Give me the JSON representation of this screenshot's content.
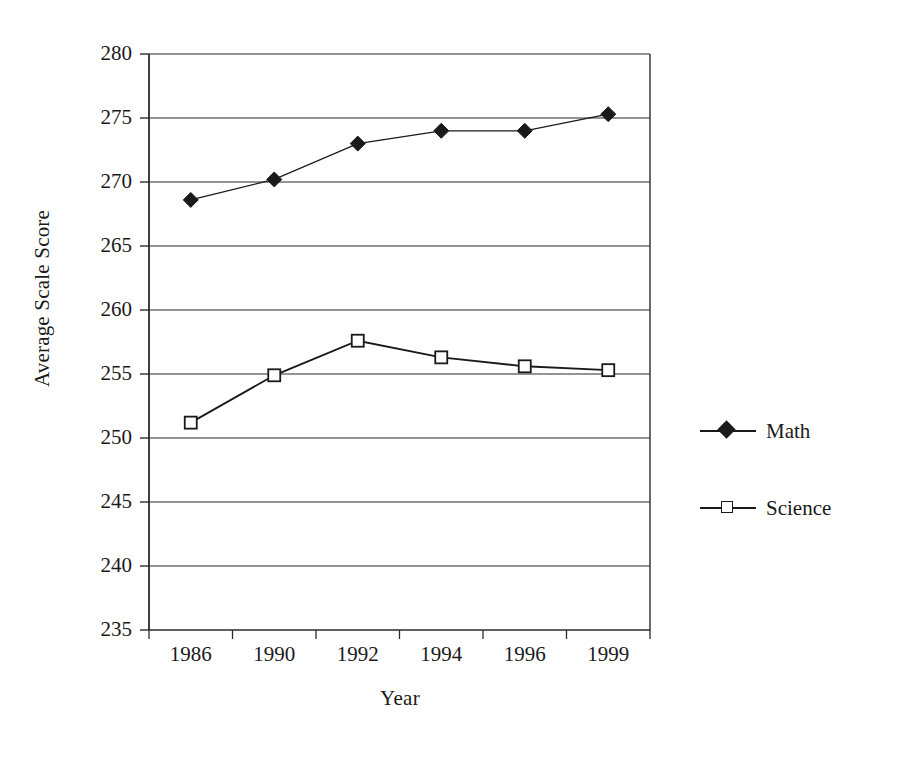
{
  "chart_data": {
    "type": "line",
    "title": "",
    "xlabel": "Year",
    "ylabel": "Average Scale Score",
    "categories": [
      "1986",
      "1990",
      "1992",
      "1994",
      "1996",
      "1999"
    ],
    "ylim": [
      235,
      280
    ],
    "yticks": [
      235,
      240,
      245,
      250,
      255,
      260,
      265,
      270,
      275,
      280
    ],
    "ytick_labels": [
      "235",
      "240",
      "245",
      "250",
      "255",
      "260",
      "265",
      "270",
      "275",
      "280"
    ],
    "grid": "horizontal",
    "legend_position": "right",
    "series": [
      {
        "name": "Math",
        "marker": "filled-diamond",
        "color": "#1a1a1a",
        "values": [
          268.6,
          270.2,
          273.0,
          274.0,
          274.0,
          275.3
        ]
      },
      {
        "name": "Science",
        "marker": "open-square",
        "color": "#1a1a1a",
        "values": [
          251.2,
          254.9,
          257.6,
          256.3,
          255.6,
          255.3
        ]
      }
    ]
  },
  "axis": {
    "y_title": "Average Scale Score",
    "x_title": "Year"
  },
  "legend": {
    "entries": [
      {
        "label": "Math",
        "marker": "filled-diamond"
      },
      {
        "label": "Science",
        "marker": "open-square"
      }
    ]
  },
  "caption": {
    "text": ""
  }
}
